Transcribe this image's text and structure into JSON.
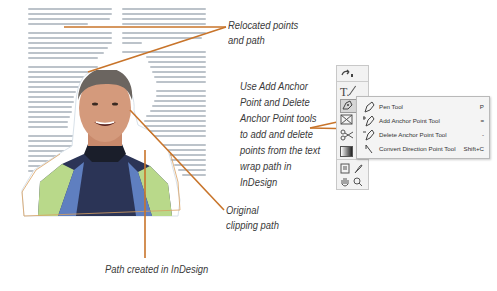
{
  "callouts": {
    "relocated": [
      "Relocated points",
      "and path"
    ],
    "use_tools": [
      "Use Add Anchor",
      "Point and Delete",
      "Anchor Point tools",
      "to add and delete",
      "points from the text",
      "wrap path in",
      "InDesign"
    ],
    "original": [
      "Original",
      "clipping path"
    ],
    "path_created": "Path created in InDesign"
  },
  "toolbox": {
    "tools": [
      "direct-select-icon",
      "type-icon",
      "pen-icon",
      "frame-icon",
      "scissors-icon",
      "gradient-icon",
      "note-icon",
      "eyedropper-icon",
      "hand-icon",
      "zoom-icon"
    ],
    "type_glyph": "T."
  },
  "flyout": {
    "items": [
      {
        "label": "Pen Tool",
        "shortcut": "P",
        "selected": false
      },
      {
        "label": "Add Anchor Point Tool",
        "shortcut": "=",
        "selected": true
      },
      {
        "label": "Delete Anchor Point Tool",
        "shortcut": "-",
        "selected": false
      },
      {
        "label": "Convert Direction Point Tool",
        "shortcut": "Shift+C",
        "selected": false
      }
    ]
  },
  "colors": {
    "leader_line": "#c8742a",
    "text": "#3a3a3a",
    "path": "#d8a060"
  }
}
